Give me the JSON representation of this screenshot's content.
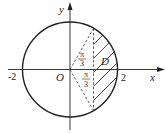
{
  "diagram": {
    "type": "region-in-circle",
    "axes": {
      "x_label": "x",
      "y_label": "y",
      "origin_label": "O",
      "x_ticks": [
        "-2",
        "2"
      ]
    },
    "circle": {
      "center": [
        0,
        0
      ],
      "radius": 2
    },
    "region_label": "D",
    "angles": [
      {
        "numerator": "π",
        "denominator": "3",
        "position": "upper"
      },
      {
        "numerator": "π",
        "denominator": "3",
        "position": "lower"
      }
    ],
    "colors": {
      "stroke": "#222222",
      "background": "#ffffff"
    }
  }
}
